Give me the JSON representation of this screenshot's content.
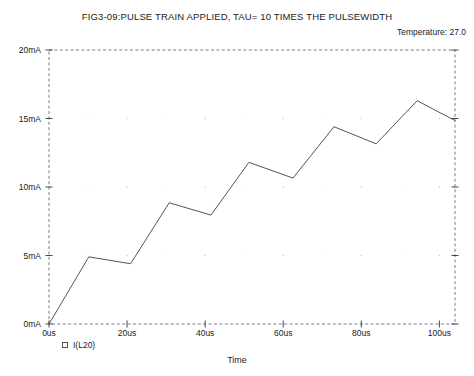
{
  "chart_data": {
    "type": "line",
    "title": "FIG3-09:PULSE TRAIN APPLIED, TAU= 10 TIMES THE PULSEWIDTH",
    "annotation": "Temperature:  27.0",
    "xlabel": "Time",
    "ylabel": "",
    "legend": [
      {
        "name": "I(L20)",
        "marker": "square",
        "color": "#555555"
      }
    ],
    "legend_position": "bottom-left",
    "grid": true,
    "grid_style": "dotted",
    "xlim": [
      0,
      104
    ],
    "ylim": [
      0,
      20
    ],
    "x_unit": "us",
    "y_unit": "mA",
    "xticks": [
      0,
      20,
      40,
      60,
      80,
      100
    ],
    "xtick_labels": [
      "0us",
      "20us",
      "40us",
      "60us",
      "80us",
      "100us"
    ],
    "yticks": [
      0,
      5,
      10,
      15,
      20
    ],
    "ytick_labels": [
      "0mA",
      "5mA",
      "10mA",
      "15mA",
      "20mA"
    ],
    "series": [
      {
        "name": "I(L20)",
        "color": "#555555",
        "x": [
          0,
          10.2,
          20.9,
          30.8,
          41.5,
          51.2,
          62.5,
          73.0,
          83.8,
          94.3,
          104.0
        ],
        "y": [
          0.0,
          4.9,
          4.4,
          8.85,
          7.95,
          11.8,
          10.65,
          14.4,
          13.15,
          16.3,
          14.85
        ]
      }
    ]
  },
  "axis_geometry": {
    "left_px": 49,
    "right_px": 455,
    "top_px": 50,
    "bottom_px": 324
  }
}
